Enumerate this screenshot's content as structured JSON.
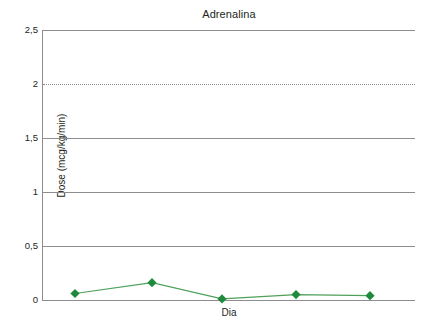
{
  "chart_data": {
    "type": "line",
    "title": "Adrenalina",
    "xlabel": "Dia",
    "ylabel": "Dose (mcg/kg/min)",
    "ylim": [
      0,
      2.5
    ],
    "ytick_labels": [
      "2,5",
      "2",
      "1,5",
      "1",
      "0,5",
      "0"
    ],
    "ytick_values": [
      2.5,
      2,
      1.5,
      1,
      0.5,
      0
    ],
    "grid": true,
    "gridlines": [
      {
        "value": 2.5,
        "style": "solid"
      },
      {
        "value": 2,
        "style": "dotted"
      },
      {
        "value": 1.5,
        "style": "solid"
      },
      {
        "value": 1,
        "style": "solid"
      },
      {
        "value": 0.5,
        "style": "solid"
      },
      {
        "value": 0,
        "style": "solid"
      }
    ],
    "legend": null,
    "categories": [
      "1",
      "2",
      "3",
      "4",
      "5"
    ],
    "x": [
      1,
      2,
      3,
      4,
      5
    ],
    "values": [
      0.06,
      0.16,
      0.01,
      0.05,
      0.04
    ],
    "series": [
      {
        "name": "Adrenalina",
        "values": [
          0.06,
          0.16,
          0.01,
          0.05,
          0.04
        ],
        "marker": "diamond",
        "color": "#2e8b3d",
        "line_color": "#4ba157"
      }
    ],
    "colors": {
      "marker": "#1f8a3c",
      "line": "#4ea05b",
      "grid": "#8d8d8d",
      "text": "#231f20",
      "background": "#ffffff"
    }
  },
  "figure": {
    "title": "Adrenalina",
    "x_axis_title": "Dia",
    "y_axis_title": "Dose (mcg/kg/min)",
    "y_ticks": [
      "2,5",
      "2",
      "1,5",
      "1",
      "0,5",
      "0"
    ]
  }
}
